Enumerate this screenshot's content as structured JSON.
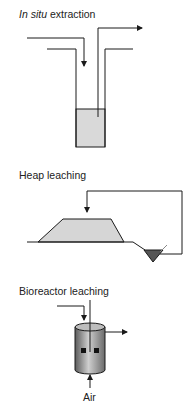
{
  "sections": {
    "in_situ": {
      "title_italic": "In situ",
      "title_rest": " extraction"
    },
    "heap": {
      "title": "Heap leaching"
    },
    "bioreactor": {
      "title": "Bioreactor leaching",
      "air_label": "Air"
    }
  },
  "colors": {
    "line": "#1a1a1a",
    "liquid": "#d9d9d9",
    "heap_fill": "#d6d6d6",
    "pond_fill": "#555555",
    "reactor_dark": "#6a6a6a",
    "reactor_light": "#c8c8c8"
  }
}
